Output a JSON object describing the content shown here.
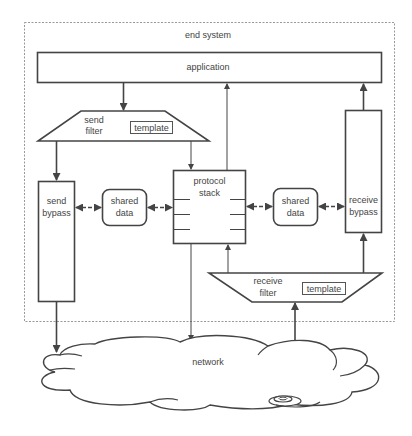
{
  "diagram": {
    "container": {
      "label": "end system"
    },
    "application": {
      "label": "application"
    },
    "send_filter": {
      "label_line1": "send",
      "label_line2": "filter",
      "template_label": "template"
    },
    "receive_filter": {
      "label_line1": "receive",
      "label_line2": "filter",
      "template_label": "template"
    },
    "send_bypass": {
      "label_line1": "send",
      "label_line2": "bypass"
    },
    "receive_bypass": {
      "label_line1": "receive",
      "label_line2": "bypass"
    },
    "shared_data_left": {
      "label_line1": "shared",
      "label_line2": "data"
    },
    "shared_data_right": {
      "label_line1": "shared",
      "label_line2": "data"
    },
    "protocol_stack": {
      "label_line1": "protocol",
      "label_line2": "stack"
    },
    "network": {
      "label": "network"
    },
    "colors": {
      "line": "#444444",
      "dashed_border": "#999999",
      "background": "#ffffff"
    }
  }
}
